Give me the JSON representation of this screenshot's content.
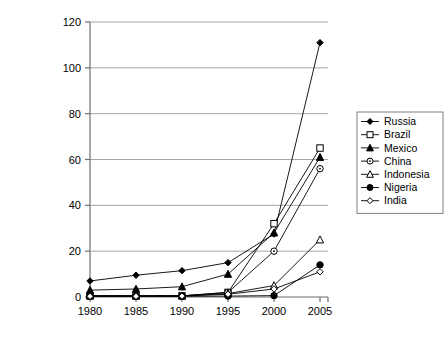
{
  "chart_data": {
    "type": "line",
    "title": "",
    "xlabel": "",
    "ylabel": "Total phones per 100 people",
    "x": [
      1980,
      1985,
      1990,
      1995,
      2000,
      2005
    ],
    "xticklabels": [
      "1980",
      "1985",
      "1990",
      "1995",
      "2000",
      "2005"
    ],
    "yticklabels": [
      "0",
      "20",
      "40",
      "60",
      "80",
      "100",
      "120"
    ],
    "yticks": [
      0,
      20,
      40,
      60,
      80,
      100,
      120
    ],
    "xlim": [
      1980,
      2005
    ],
    "ylim": [
      0,
      120
    ],
    "grid": "horizontal",
    "legend_position": "right",
    "series": [
      {
        "name": "Russia",
        "marker": "filled-diamond",
        "color": "#000000",
        "values": [
          7,
          9.5,
          11.5,
          15,
          27.5,
          111
        ]
      },
      {
        "name": "Brazil",
        "marker": "open-square",
        "color": "#000000",
        "values": [
          0.5,
          0.5,
          0.5,
          2,
          32,
          65
        ]
      },
      {
        "name": "Mexico",
        "marker": "filled-triangle",
        "color": "#000000",
        "values": [
          3,
          3.5,
          4.5,
          10,
          28,
          61
        ]
      },
      {
        "name": "China",
        "marker": "open-circle-dot",
        "color": "#000000",
        "values": [
          0.5,
          0.5,
          0.5,
          2,
          20,
          56
        ]
      },
      {
        "name": "Indonesia",
        "marker": "open-triangle",
        "color": "#000000",
        "values": [
          0.5,
          0.5,
          0.5,
          1.5,
          5,
          25
        ]
      },
      {
        "name": "Nigeria",
        "marker": "filled-circle",
        "color": "#000000",
        "values": [
          0.3,
          0.3,
          0.3,
          0.4,
          0.6,
          14
        ]
      },
      {
        "name": "India",
        "marker": "open-diamond",
        "color": "#000000",
        "values": [
          0.3,
          0.3,
          0.4,
          1.2,
          3.5,
          11
        ]
      }
    ]
  },
  "axes": {
    "y_title": "Total phones per 100 people"
  },
  "colors": {
    "line": "#000000",
    "grid": "#a8a8a8",
    "axis": "#6e6e6e",
    "legend_border": "#808080",
    "background": "#ffffff"
  }
}
